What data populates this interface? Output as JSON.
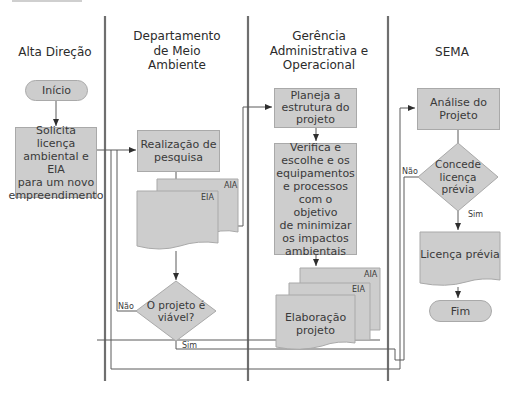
{
  "lanes": [
    {
      "title": "Alta Direção"
    },
    {
      "title": "Departamento de Meio Ambiente"
    },
    {
      "title": "Gerência Administrativa e Operacional"
    },
    {
      "title": "SEMA"
    }
  ],
  "lane_titles_lines": {
    "alta": [
      "Alta Direção"
    ],
    "dept": [
      "Departamento",
      "de Meio",
      "Ambiente"
    ],
    "gerencia": [
      "Gerência",
      "Administrativa e",
      "Operacional"
    ],
    "sema": [
      "SEMA"
    ]
  },
  "nodes": {
    "inicio": "Início",
    "solicita": [
      "Solicita licença",
      "ambiental e EIA",
      "para um novo",
      "empreendimento"
    ],
    "realizacao": [
      "Realização de",
      "pesquisa"
    ],
    "docs1": {
      "back": "AIA",
      "front": "EIA"
    },
    "viavel": [
      "O projeto é",
      "viável?"
    ],
    "planeja": [
      "Planeja a",
      "estrutura do",
      "projeto"
    ],
    "verifica": [
      "Verifica e",
      "escolhe e os",
      "equipamentos",
      "e processos",
      "com o objetivo",
      "de minimizar",
      "os impactos",
      "ambientais"
    ],
    "elaboracao": {
      "back": "AIA",
      "middle": "EIA",
      "front": [
        "Elaboração",
        "projeto"
      ]
    },
    "analise": [
      "Análise do",
      "Projeto"
    ],
    "concede": [
      "Concede",
      "licença",
      "prévia"
    ],
    "licenca": "Licença prévia",
    "fim": "Fim"
  },
  "edge_labels": {
    "viavel_no": "Não",
    "viavel_yes": "Sim",
    "concede_no": "Não",
    "concede_yes": "Sim"
  },
  "colors": {
    "node_fill": "#cdcdcd",
    "node_border": "#a9a9a9",
    "lane_divider": "#6f6f6f",
    "connector": "#5a5a5a"
  }
}
